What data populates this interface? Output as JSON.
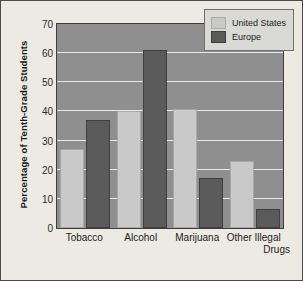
{
  "chart_data": {
    "type": "bar",
    "title": "",
    "xlabel": "",
    "ylabel": "Percentage of Tenth-Grade Students",
    "ylim": [
      0,
      70
    ],
    "yticks": [
      70,
      60,
      50,
      40,
      30,
      20,
      10,
      0
    ],
    "grid": true,
    "legend_position": "top-right",
    "categories": [
      "Tobacco",
      "Alcohol",
      "Marijuana",
      "Other Illegal Drugs"
    ],
    "category_lines": [
      [
        "Tobacco"
      ],
      [
        "Alcohol"
      ],
      [
        "Marijuana"
      ],
      [
        "Other Illegal",
        "Drugs"
      ]
    ],
    "series": [
      {
        "name": "United States",
        "color": "#c9c9c9",
        "values": [
          27,
          40,
          41,
          23
        ]
      },
      {
        "name": "Europe",
        "color": "#5a5a5a",
        "values": [
          37,
          61,
          17,
          6.5
        ]
      }
    ]
  },
  "legend": {
    "items": [
      {
        "label": "United States"
      },
      {
        "label": "Europe"
      }
    ]
  },
  "axis": {
    "y_title": "Percentage of Tenth-Grade Students"
  }
}
